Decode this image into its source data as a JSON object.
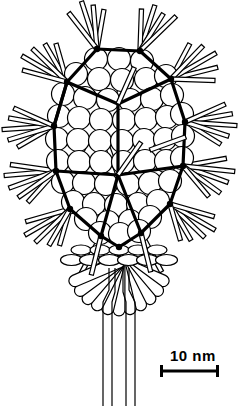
{
  "figure": {
    "background_color": "#ffffff",
    "ink_color": "#000000"
  },
  "scale_bar": {
    "label": "10 nm",
    "label_x": 170,
    "label_y": 347,
    "bar_x1": 160,
    "bar_x2": 219,
    "bar_y": 371,
    "cap_half_height": 6,
    "bar_thickness": 3,
    "color": "#000000"
  },
  "capsid": {
    "center_x": 118,
    "center_y": 143,
    "capsomer_radius": 11.5,
    "capsomer_stroke": 1.2,
    "lattice_stroke": 3.2,
    "vertex_radius": 3.2,
    "capsomers": [
      [
        96,
        59
      ],
      [
        119,
        59
      ],
      [
        142,
        61
      ],
      [
        76,
        74
      ],
      [
        99,
        79
      ],
      [
        122,
        80
      ],
      [
        146,
        79
      ],
      [
        166,
        76
      ],
      [
        63,
        94
      ],
      [
        85,
        98
      ],
      [
        108,
        100
      ],
      [
        130,
        100
      ],
      [
        152,
        99
      ],
      [
        172,
        95
      ],
      [
        59,
        116
      ],
      [
        79,
        118
      ],
      [
        101,
        120
      ],
      [
        124,
        120
      ],
      [
        146,
        119
      ],
      [
        167,
        117
      ],
      [
        182,
        114
      ],
      [
        57,
        139
      ],
      [
        78,
        140
      ],
      [
        100,
        141
      ],
      [
        122,
        141
      ],
      [
        144,
        140
      ],
      [
        165,
        139
      ],
      [
        183,
        136
      ],
      [
        58,
        161
      ],
      [
        79,
        162
      ],
      [
        101,
        162
      ],
      [
        123,
        162
      ],
      [
        145,
        161
      ],
      [
        166,
        161
      ],
      [
        182,
        158
      ],
      [
        63,
        182
      ],
      [
        84,
        183
      ],
      [
        106,
        184
      ],
      [
        128,
        184
      ],
      [
        150,
        183
      ],
      [
        170,
        181
      ],
      [
        73,
        202
      ],
      [
        94,
        204
      ],
      [
        116,
        205
      ],
      [
        138,
        204
      ],
      [
        158,
        201
      ],
      [
        86,
        219
      ],
      [
        108,
        222
      ],
      [
        130,
        221
      ],
      [
        150,
        217
      ],
      [
        100,
        233
      ],
      [
        120,
        234
      ],
      [
        139,
        231
      ]
    ],
    "lattice_vertices": [
      [
        97,
        49
      ],
      [
        140,
        51
      ],
      [
        67,
        82
      ],
      [
        171,
        79
      ],
      [
        54,
        126
      ],
      [
        185,
        122
      ],
      [
        56,
        171
      ],
      [
        183,
        166
      ],
      [
        70,
        209
      ],
      [
        170,
        204
      ],
      [
        101,
        236
      ],
      [
        141,
        233
      ],
      [
        119,
        247
      ]
    ],
    "lattice_edges": [
      [
        [
          97,
          49
        ],
        [
          140,
          51
        ]
      ],
      [
        [
          97,
          49
        ],
        [
          67,
          82
        ]
      ],
      [
        [
          140,
          51
        ],
        [
          171,
          79
        ]
      ],
      [
        [
          67,
          82
        ],
        [
          54,
          126
        ]
      ],
      [
        [
          171,
          79
        ],
        [
          185,
          122
        ]
      ],
      [
        [
          54,
          126
        ],
        [
          56,
          171
        ]
      ],
      [
        [
          185,
          122
        ],
        [
          183,
          166
        ]
      ],
      [
        [
          56,
          171
        ],
        [
          70,
          209
        ]
      ],
      [
        [
          183,
          166
        ],
        [
          170,
          204
        ]
      ],
      [
        [
          70,
          209
        ],
        [
          101,
          236
        ]
      ],
      [
        [
          170,
          204
        ],
        [
          141,
          233
        ]
      ],
      [
        [
          101,
          236
        ],
        [
          119,
          247
        ]
      ],
      [
        [
          141,
          233
        ],
        [
          119,
          247
        ]
      ],
      [
        [
          118,
          104
        ],
        [
          118,
          175
        ]
      ],
      [
        [
          118,
          104
        ],
        [
          67,
          82
        ]
      ],
      [
        [
          118,
          104
        ],
        [
          171,
          79
        ]
      ],
      [
        [
          118,
          175
        ],
        [
          56,
          171
        ]
      ],
      [
        [
          118,
          175
        ],
        [
          183,
          166
        ]
      ],
      [
        [
          67,
          82
        ],
        [
          54,
          126
        ]
      ],
      [
        [
          101,
          236
        ],
        [
          118,
          175
        ]
      ],
      [
        [
          141,
          233
        ],
        [
          118,
          175
        ]
      ]
    ]
  },
  "spikes": {
    "tube_width": 4.2,
    "stroke": 1.2,
    "count": 58,
    "items": [
      {
        "x": 97,
        "y": 49,
        "a": -108,
        "l": 50
      },
      {
        "x": 97,
        "y": 49,
        "a": -95,
        "l": 44
      },
      {
        "x": 97,
        "y": 49,
        "a": -80,
        "l": 40
      },
      {
        "x": 97,
        "y": 49,
        "a": -128,
        "l": 46
      },
      {
        "x": 140,
        "y": 51,
        "a": -72,
        "l": 48
      },
      {
        "x": 140,
        "y": 51,
        "a": -58,
        "l": 44
      },
      {
        "x": 140,
        "y": 51,
        "a": -88,
        "l": 42
      },
      {
        "x": 140,
        "y": 51,
        "a": -44,
        "l": 50
      },
      {
        "x": 67,
        "y": 82,
        "a": -150,
        "l": 52
      },
      {
        "x": 67,
        "y": 82,
        "a": -136,
        "l": 48
      },
      {
        "x": 67,
        "y": 82,
        "a": -120,
        "l": 44
      },
      {
        "x": 67,
        "y": 82,
        "a": -165,
        "l": 46
      },
      {
        "x": 67,
        "y": 82,
        "a": -106,
        "l": 40
      },
      {
        "x": 171,
        "y": 79,
        "a": -30,
        "l": 52
      },
      {
        "x": 171,
        "y": 79,
        "a": -14,
        "l": 48
      },
      {
        "x": 171,
        "y": 79,
        "a": -46,
        "l": 46
      },
      {
        "x": 171,
        "y": 79,
        "a": -62,
        "l": 40
      },
      {
        "x": 171,
        "y": 79,
        "a": 2,
        "l": 44
      },
      {
        "x": 54,
        "y": 126,
        "a": 176,
        "l": 52
      },
      {
        "x": 54,
        "y": 126,
        "a": 163,
        "l": 48
      },
      {
        "x": 54,
        "y": 126,
        "a": -170,
        "l": 46
      },
      {
        "x": 54,
        "y": 126,
        "a": -156,
        "l": 44
      },
      {
        "x": 54,
        "y": 126,
        "a": 150,
        "l": 42
      },
      {
        "x": 185,
        "y": 122,
        "a": 4,
        "l": 52
      },
      {
        "x": 185,
        "y": 122,
        "a": -10,
        "l": 48
      },
      {
        "x": 185,
        "y": 122,
        "a": 18,
        "l": 46
      },
      {
        "x": 185,
        "y": 122,
        "a": 32,
        "l": 42
      },
      {
        "x": 185,
        "y": 122,
        "a": -24,
        "l": 44
      },
      {
        "x": 56,
        "y": 171,
        "a": 175,
        "l": 52
      },
      {
        "x": 56,
        "y": 171,
        "a": 160,
        "l": 50
      },
      {
        "x": 56,
        "y": 171,
        "a": -172,
        "l": 46
      },
      {
        "x": 56,
        "y": 171,
        "a": 145,
        "l": 46
      },
      {
        "x": 56,
        "y": 171,
        "a": 132,
        "l": 42
      },
      {
        "x": 183,
        "y": 166,
        "a": 6,
        "l": 52
      },
      {
        "x": 183,
        "y": 166,
        "a": 20,
        "l": 48
      },
      {
        "x": 183,
        "y": 166,
        "a": 36,
        "l": 46
      },
      {
        "x": 183,
        "y": 166,
        "a": -10,
        "l": 44
      },
      {
        "x": 183,
        "y": 166,
        "a": 50,
        "l": 40
      },
      {
        "x": 70,
        "y": 209,
        "a": 150,
        "l": 52
      },
      {
        "x": 70,
        "y": 209,
        "a": 136,
        "l": 48
      },
      {
        "x": 70,
        "y": 209,
        "a": 164,
        "l": 46
      },
      {
        "x": 70,
        "y": 209,
        "a": 120,
        "l": 42
      },
      {
        "x": 70,
        "y": 209,
        "a": 106,
        "l": 38
      },
      {
        "x": 170,
        "y": 204,
        "a": 30,
        "l": 52
      },
      {
        "x": 170,
        "y": 204,
        "a": 44,
        "l": 48
      },
      {
        "x": 170,
        "y": 204,
        "a": 16,
        "l": 46
      },
      {
        "x": 170,
        "y": 204,
        "a": 60,
        "l": 42
      },
      {
        "x": 170,
        "y": 204,
        "a": 74,
        "l": 38
      },
      {
        "x": 101,
        "y": 236,
        "a": 118,
        "l": 44
      },
      {
        "x": 101,
        "y": 236,
        "a": 104,
        "l": 40
      },
      {
        "x": 141,
        "y": 233,
        "a": 62,
        "l": 44
      },
      {
        "x": 141,
        "y": 233,
        "a": 76,
        "l": 40
      },
      {
        "x": 118,
        "y": 104,
        "a": -84,
        "l": 46
      },
      {
        "x": 118,
        "y": 104,
        "a": -66,
        "l": 40
      },
      {
        "x": 118,
        "y": 175,
        "a": 250,
        "l": 44
      },
      {
        "x": 118,
        "y": 175,
        "a": -55,
        "l": 40
      },
      {
        "x": 85,
        "y": 150,
        "a": 205,
        "l": 38
      },
      {
        "x": 150,
        "y": 150,
        "a": -20,
        "l": 38
      }
    ]
  },
  "baseplate": {
    "disc_rows": [
      {
        "cy": 250,
        "count": 5,
        "rx": 10,
        "ry": 5,
        "spacing": 19
      },
      {
        "cy": 260,
        "count": 6,
        "rx": 11,
        "ry": 5.5,
        "spacing": 19
      }
    ],
    "center_x": 119
  },
  "tail_fibers": {
    "count": 11,
    "origin_x": 119,
    "origin_y": 262,
    "length": 48,
    "width": 13,
    "spread_deg": 134
  },
  "tail_tube": {
    "lines": [
      [
        [
          109,
          268
        ],
        [
          109,
          290
        ],
        [
          103,
          302
        ],
        [
          103,
          406
        ]
      ],
      [
        [
          115,
          268
        ],
        [
          115,
          292
        ],
        [
          112,
          302
        ],
        [
          112,
          406
        ]
      ],
      [
        [
          123,
          268
        ],
        [
          123,
          292
        ],
        [
          126,
          302
        ],
        [
          126,
          406
        ]
      ],
      [
        [
          129,
          268
        ],
        [
          129,
          290
        ],
        [
          135,
          302
        ],
        [
          135,
          406
        ]
      ]
    ],
    "stroke": 1.2
  }
}
